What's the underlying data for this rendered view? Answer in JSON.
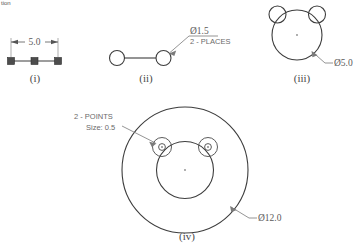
{
  "page": {
    "corner_note": "tion",
    "background": "#ffffff",
    "ink_color": "#3d3d3d",
    "annotation_color": "#7a7a7a"
  },
  "figures": [
    {
      "id": "fig-i",
      "caption": "(i)",
      "description": "three points on a horizontal line with linear dimension",
      "dimension_label": "5.0",
      "point_count": 3
    },
    {
      "id": "fig-ii",
      "caption": "(ii)",
      "description": "two circles joined by a centerline",
      "leader_label_line1": "Ø1.5",
      "leader_label_line2": "2 - PLACES",
      "circle_count": 2
    },
    {
      "id": "fig-iii",
      "caption": "(iii)",
      "description": "large circle with two tangent small circles at upper corners",
      "leader_label": "Ø5.0"
    },
    {
      "id": "fig-iv",
      "caption": "(iv)",
      "description": "large outer circle containing an inner circle and two small point circles",
      "leader_label": "Ø12.0",
      "note_line1": "2 - POINTS",
      "note_line2": "Size: 0.5"
    }
  ]
}
